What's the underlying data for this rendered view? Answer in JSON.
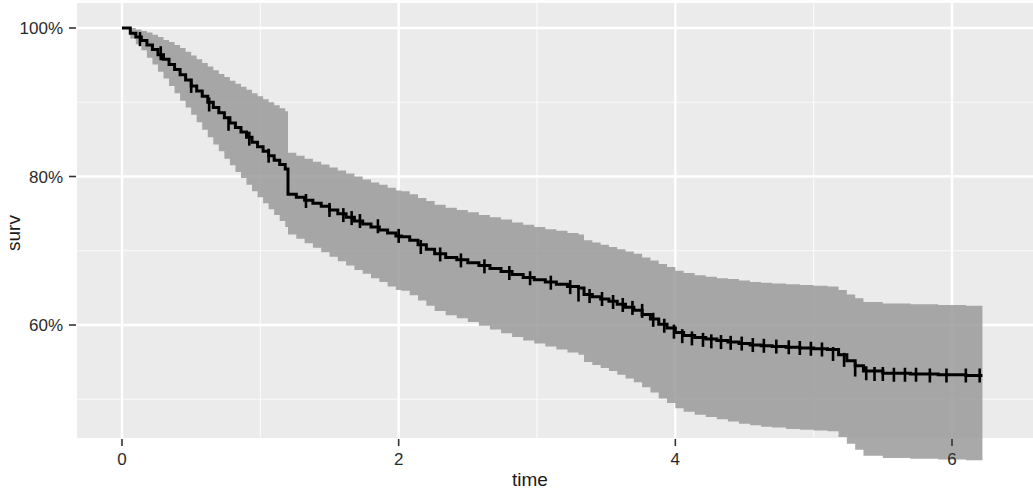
{
  "chart_data": {
    "type": "line",
    "subtype": "kaplan-meier-survival-curve",
    "title": "",
    "xlabel": "time",
    "ylabel": "surv",
    "xlim": [
      -0.22,
      6.55
    ],
    "ylim": [
      0.44,
      1.02
    ],
    "grid": true,
    "legend": null,
    "xticks": [
      0,
      2,
      4,
      6
    ],
    "xtick_labels": [
      "0",
      "2",
      "4",
      "6"
    ],
    "yticks": [
      0.6,
      0.8,
      1.0
    ],
    "ytick_labels": [
      "60%",
      "80%",
      "100%"
    ],
    "panel_background": "#ebebeb",
    "gridline_color": "#ffffff",
    "line_color": "#000000",
    "band_color": "#9a9a9a",
    "band_opacity": 0.85,
    "series": [
      {
        "name": "surv",
        "step": "hv",
        "x": [
          0.0,
          0.06,
          0.1,
          0.14,
          0.18,
          0.22,
          0.26,
          0.3,
          0.34,
          0.38,
          0.42,
          0.46,
          0.5,
          0.54,
          0.58,
          0.62,
          0.66,
          0.7,
          0.74,
          0.78,
          0.82,
          0.86,
          0.9,
          0.94,
          0.98,
          1.02,
          1.06,
          1.1,
          1.14,
          1.18,
          1.2,
          1.26,
          1.32,
          1.38,
          1.44,
          1.5,
          1.56,
          1.62,
          1.68,
          1.74,
          1.8,
          1.86,
          1.92,
          1.98,
          2.02,
          2.08,
          2.14,
          2.2,
          2.26,
          2.34,
          2.42,
          2.5,
          2.58,
          2.66,
          2.74,
          2.82,
          2.9,
          2.98,
          3.06,
          3.14,
          3.22,
          3.3,
          3.34,
          3.4,
          3.46,
          3.52,
          3.58,
          3.64,
          3.7,
          3.76,
          3.82,
          3.88,
          3.94,
          4.0,
          4.06,
          4.14,
          4.22,
          4.3,
          4.38,
          4.46,
          4.54,
          4.62,
          4.7,
          4.8,
          4.9,
          5.0,
          5.1,
          5.18,
          5.24,
          5.3,
          5.36,
          5.5,
          5.7,
          5.9,
          6.1,
          6.22
        ],
        "y": [
          1.0,
          0.993,
          0.988,
          0.983,
          0.977,
          0.971,
          0.964,
          0.958,
          0.951,
          0.944,
          0.937,
          0.93,
          0.922,
          0.915,
          0.908,
          0.9,
          0.893,
          0.886,
          0.879,
          0.872,
          0.866,
          0.86,
          0.853,
          0.846,
          0.84,
          0.834,
          0.828,
          0.822,
          0.816,
          0.81,
          0.776,
          0.772,
          0.768,
          0.764,
          0.76,
          0.755,
          0.75,
          0.745,
          0.74,
          0.736,
          0.732,
          0.728,
          0.724,
          0.72,
          0.719,
          0.714,
          0.708,
          0.702,
          0.696,
          0.691,
          0.688,
          0.684,
          0.68,
          0.676,
          0.672,
          0.668,
          0.664,
          0.661,
          0.658,
          0.655,
          0.652,
          0.65,
          0.641,
          0.638,
          0.635,
          0.632,
          0.628,
          0.624,
          0.62,
          0.614,
          0.608,
          0.601,
          0.596,
          0.59,
          0.586,
          0.583,
          0.581,
          0.579,
          0.577,
          0.575,
          0.573,
          0.572,
          0.571,
          0.57,
          0.569,
          0.568,
          0.567,
          0.56,
          0.552,
          0.545,
          0.538,
          0.535,
          0.534,
          0.533,
          0.532,
          0.532
        ],
        "lower": [
          1.0,
          0.986,
          0.978,
          0.97,
          0.96,
          0.951,
          0.941,
          0.932,
          0.922,
          0.912,
          0.902,
          0.893,
          0.883,
          0.873,
          0.863,
          0.853,
          0.843,
          0.834,
          0.824,
          0.815,
          0.806,
          0.798,
          0.789,
          0.78,
          0.772,
          0.764,
          0.756,
          0.748,
          0.74,
          0.732,
          0.722,
          0.716,
          0.71,
          0.704,
          0.698,
          0.692,
          0.686,
          0.68,
          0.674,
          0.669,
          0.663,
          0.658,
          0.652,
          0.647,
          0.646,
          0.64,
          0.633,
          0.626,
          0.619,
          0.613,
          0.609,
          0.604,
          0.599,
          0.594,
          0.589,
          0.584,
          0.579,
          0.575,
          0.571,
          0.567,
          0.563,
          0.56,
          0.55,
          0.546,
          0.542,
          0.538,
          0.533,
          0.528,
          0.523,
          0.516,
          0.509,
          0.501,
          0.495,
          0.488,
          0.483,
          0.479,
          0.476,
          0.473,
          0.47,
          0.467,
          0.465,
          0.463,
          0.462,
          0.46,
          0.459,
          0.458,
          0.457,
          0.449,
          0.44,
          0.432,
          0.424,
          0.421,
          0.42,
          0.419,
          0.418,
          0.418
        ],
        "upper": [
          1.0,
          1.0,
          0.998,
          0.996,
          0.994,
          0.991,
          0.988,
          0.984,
          0.981,
          0.977,
          0.973,
          0.968,
          0.963,
          0.958,
          0.953,
          0.948,
          0.943,
          0.938,
          0.934,
          0.929,
          0.925,
          0.921,
          0.917,
          0.912,
          0.908,
          0.904,
          0.9,
          0.896,
          0.892,
          0.888,
          0.832,
          0.828,
          0.824,
          0.82,
          0.816,
          0.812,
          0.808,
          0.804,
          0.8,
          0.796,
          0.792,
          0.789,
          0.785,
          0.781,
          0.78,
          0.776,
          0.771,
          0.767,
          0.762,
          0.758,
          0.755,
          0.752,
          0.748,
          0.745,
          0.742,
          0.738,
          0.735,
          0.732,
          0.729,
          0.727,
          0.724,
          0.722,
          0.714,
          0.711,
          0.708,
          0.705,
          0.702,
          0.699,
          0.696,
          0.691,
          0.687,
          0.682,
          0.678,
          0.673,
          0.67,
          0.667,
          0.665,
          0.663,
          0.662,
          0.66,
          0.658,
          0.657,
          0.656,
          0.655,
          0.654,
          0.653,
          0.652,
          0.647,
          0.641,
          0.636,
          0.631,
          0.629,
          0.628,
          0.627,
          0.626,
          0.626
        ]
      }
    ],
    "censor_marks": {
      "symbol": "+",
      "x": [
        0.13,
        0.28,
        0.5,
        0.63,
        0.77,
        0.92,
        1.06,
        1.33,
        1.5,
        1.6,
        1.66,
        1.72,
        1.85,
        2.0,
        2.16,
        2.3,
        2.45,
        2.62,
        2.8,
        2.95,
        3.1,
        3.24,
        3.3,
        3.38,
        3.47,
        3.55,
        3.62,
        3.69,
        3.76,
        3.84,
        3.92,
        3.99,
        4.05,
        4.12,
        4.2,
        4.26,
        4.33,
        4.4,
        4.48,
        4.56,
        4.64,
        4.73,
        4.82,
        4.9,
        4.98,
        5.06,
        5.14,
        5.22,
        5.3,
        5.38,
        5.44,
        5.5,
        5.58,
        5.66,
        5.74,
        5.84,
        5.96,
        6.1,
        6.2
      ],
      "y": [
        0.985,
        0.966,
        0.922,
        0.897,
        0.871,
        0.851,
        0.828,
        0.767,
        0.755,
        0.748,
        0.744,
        0.74,
        0.733,
        0.72,
        0.705,
        0.695,
        0.687,
        0.679,
        0.67,
        0.663,
        0.657,
        0.651,
        0.641,
        0.639,
        0.635,
        0.631,
        0.627,
        0.623,
        0.619,
        0.607,
        0.599,
        0.591,
        0.585,
        0.582,
        0.58,
        0.578,
        0.577,
        0.576,
        0.575,
        0.573,
        0.572,
        0.571,
        0.57,
        0.569,
        0.568,
        0.567,
        0.561,
        0.553,
        0.54,
        0.535,
        0.534,
        0.534,
        0.533,
        0.533,
        0.533,
        0.532,
        0.532,
        0.532,
        0.532
      ]
    }
  }
}
